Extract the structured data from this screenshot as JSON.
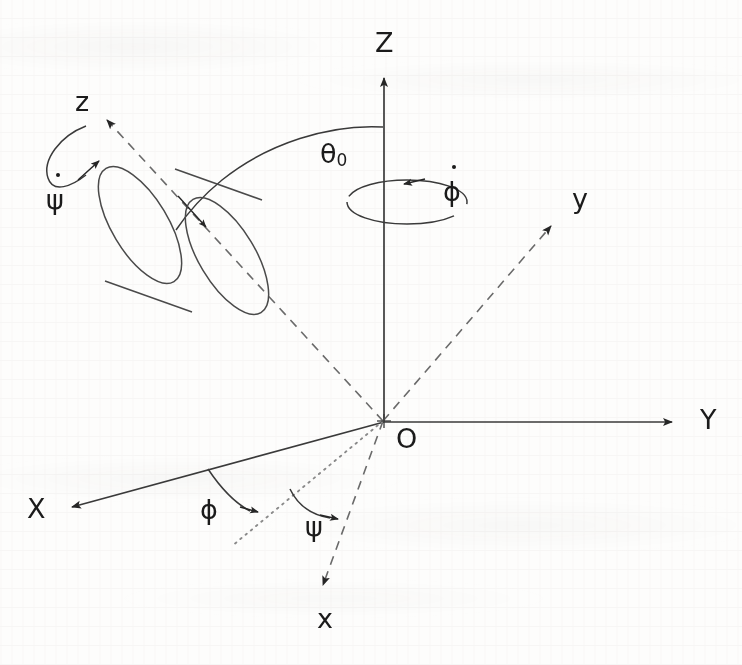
{
  "figure": {
    "background_color": "#fdfdfc",
    "ink_color": "#1b1b1b",
    "stroke_color": "#3a3a3a"
  },
  "axes": {
    "fixed_frame": [
      {
        "name": "Z",
        "label": "Z",
        "style": "solid",
        "direction": "up",
        "tip": [
          384,
          72
        ],
        "label_pos": [
          375,
          30
        ]
      },
      {
        "name": "Y",
        "label": "Y",
        "style": "solid",
        "direction": "right",
        "tip": [
          678,
          422
        ],
        "label_pos": [
          700,
          406
        ]
      },
      {
        "name": "X",
        "label": "X",
        "style": "solid",
        "direction": "down-left",
        "tip": [
          63,
          509
        ],
        "label_pos": [
          27,
          495
        ]
      }
    ],
    "body_frame": [
      {
        "name": "z",
        "label": "z",
        "style": "dashed",
        "direction": "up-left",
        "tip": [
          100,
          113
        ],
        "label_pos": [
          75,
          88
        ]
      },
      {
        "name": "y",
        "label": "y",
        "style": "dashed",
        "direction": "up-right",
        "tip": [
          558,
          219
        ],
        "label_pos": [
          572,
          185
        ]
      },
      {
        "name": "x",
        "label": "x",
        "style": "dashed",
        "direction": "down-right",
        "tip": [
          327,
          594
        ],
        "label_pos": [
          317,
          605
        ]
      }
    ],
    "line_of_nodes": {
      "name": "line-of-nodes",
      "style": "dotted",
      "from": [
        383,
        422
      ],
      "to": [
        232,
        545
      ]
    },
    "origin": {
      "label": "O",
      "pos": [
        383,
        422
      ],
      "label_pos": [
        396,
        425
      ]
    }
  },
  "angle_labels": [
    {
      "name": "theta-zero",
      "symbol": "θ",
      "subscript": "0",
      "pos": [
        320,
        140
      ],
      "arc": "between Z axis and body z axis"
    },
    {
      "name": "phi",
      "symbol": "ϕ",
      "subscript": "",
      "pos": [
        200,
        496
      ],
      "arc": "between X axis and line of nodes"
    },
    {
      "name": "psi",
      "symbol": "ψ",
      "subscript": "",
      "pos": [
        305,
        513
      ],
      "arc": "between line of nodes and body x axis"
    }
  ],
  "rate_labels": [
    {
      "name": "phi-dot",
      "symbol": "ϕ",
      "dot": true,
      "pos": [
        443,
        178
      ],
      "meaning": "precession rate about Z"
    },
    {
      "name": "psi-dot",
      "symbol": "ψ",
      "dot": true,
      "pos": [
        46,
        186
      ],
      "meaning": "spin rate about body z"
    }
  ],
  "body": {
    "name": "cylinder-top",
    "shape": "cylinder",
    "axis": "body z axis",
    "front_face_center": [
      226,
      254
    ],
    "back_face_center": [
      135,
      223
    ]
  }
}
